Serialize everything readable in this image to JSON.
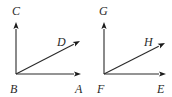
{
  "figures": [
    {
      "name": "left-angle-figure",
      "vertex": {
        "label": "B",
        "x": 16,
        "y": 74,
        "label_x": 10,
        "label_y": 93
      },
      "rays": [
        {
          "label": "C",
          "tip_x": 16,
          "tip_y": 22,
          "label_x": 12,
          "label_y": 15,
          "direction": "up"
        },
        {
          "label": "D",
          "tip_x": 80,
          "tip_y": 41,
          "label_x": 57,
          "label_y": 46,
          "direction": "diagonal"
        },
        {
          "label": "A",
          "tip_x": 81,
          "tip_y": 74,
          "label_x": 75,
          "label_y": 93,
          "direction": "right"
        }
      ]
    },
    {
      "name": "right-angle-figure",
      "vertex": {
        "label": "F",
        "x": 104,
        "y": 74,
        "label_x": 97,
        "label_y": 93
      },
      "rays": [
        {
          "label": "G",
          "tip_x": 104,
          "tip_y": 22,
          "label_x": 99,
          "label_y": 15,
          "direction": "up"
        },
        {
          "label": "H",
          "tip_x": 165,
          "tip_y": 43,
          "label_x": 144,
          "label_y": 46,
          "direction": "diagonal"
        },
        {
          "label": "E",
          "tip_x": 166,
          "tip_y": 74,
          "label_x": 157,
          "label_y": 93,
          "direction": "right"
        }
      ]
    }
  ],
  "colors": {
    "line": "#2a2a2a",
    "background": "#ffffff"
  }
}
